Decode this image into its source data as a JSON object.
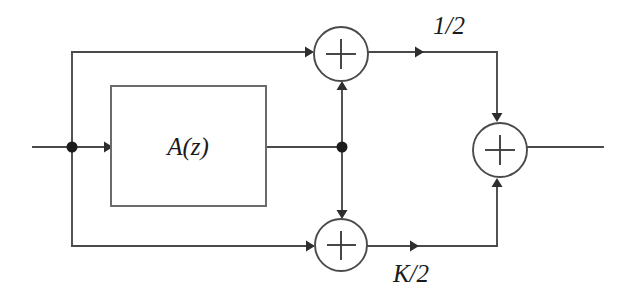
{
  "diagram": {
    "type": "signal-flow-block-diagram",
    "colors": {
      "wire": "#4a4a4a",
      "block_outline": "#6b6b6b",
      "node_dot": "#1c1c1c",
      "text": "#1a1a1a",
      "background": "#ffffff"
    },
    "blocks": [
      {
        "id": "az-block",
        "label": "A(z)",
        "shape": "rectangle",
        "x": 111,
        "y": 86,
        "width": 155,
        "height": 120
      }
    ],
    "adders": [
      {
        "id": "top-adder",
        "label": "+",
        "cx": 341,
        "cy": 54,
        "r": 27
      },
      {
        "id": "bottom-adder",
        "label": "+",
        "cx": 341,
        "cy": 245,
        "r": 26
      },
      {
        "id": "output-adder",
        "label": "+",
        "cx": 500,
        "cy": 150,
        "r": 27
      }
    ],
    "nodes": [
      {
        "id": "input-split-node",
        "cx": 72,
        "cy": 147,
        "r": 5
      },
      {
        "id": "az-output-split-node",
        "cx": 342,
        "cy": 147,
        "r": 5
      }
    ],
    "gain_labels": [
      {
        "id": "upper-branch-gain",
        "text": "1/2",
        "x": 449,
        "y": 28
      },
      {
        "id": "lower-branch-gain",
        "text": "K/2",
        "x": 411,
        "y": 276
      }
    ],
    "ports": [
      {
        "id": "signal-input",
        "x": 33,
        "y": 147
      },
      {
        "id": "signal-output",
        "x": 603,
        "y": 147
      }
    ]
  }
}
